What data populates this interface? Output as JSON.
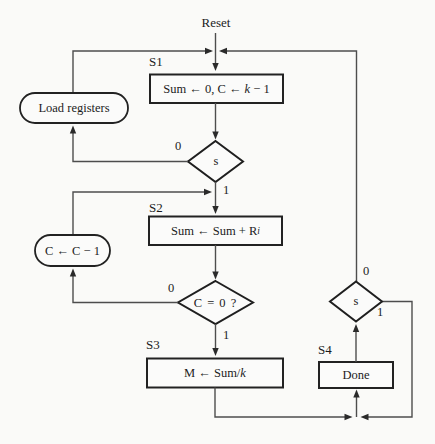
{
  "figure": {
    "reset_label": "Reset",
    "states": {
      "s1": {
        "label": "S1",
        "pre": "Sum ← 0, C ← ",
        "var": "k",
        "post": " − 1"
      },
      "s2": {
        "label": "S2",
        "pre": "Sum ← Sum + R",
        "sub": "i"
      },
      "s3": {
        "label": "S3",
        "pre": "M ← Sum/",
        "var": "k"
      },
      "s4": {
        "label": "S4",
        "text": "Done"
      }
    },
    "actions": {
      "load": "Load registers",
      "decrement": "C ← C − 1"
    },
    "decisions": {
      "s_top": {
        "text": "s",
        "no": "0",
        "yes": "1"
      },
      "c_zero": {
        "text": "C = 0 ?",
        "no": "0",
        "yes": "1"
      },
      "s_right": {
        "text": "s",
        "no": "0",
        "yes": "1"
      }
    },
    "colors": {
      "background": "#fafaf8",
      "line": "#4d4d4d",
      "shape_border": "#1f1f1f",
      "text": "#1c1c1c"
    }
  }
}
